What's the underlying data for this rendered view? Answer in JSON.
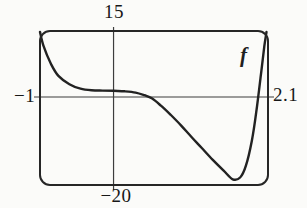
{
  "figure": {
    "function_label": "f",
    "ticks": {
      "top": "15",
      "left": "−1",
      "right": "2.1",
      "bottom": "−20"
    }
  },
  "chart_data": {
    "type": "line",
    "title": "",
    "xlabel": "",
    "ylabel": "",
    "xlim": [
      -1,
      2.1
    ],
    "ylim": [
      -20,
      15
    ],
    "grid": false,
    "legend_position": "inline-top-right",
    "axes": "centered cross axes inside rounded viewport, tick values shown at window edges",
    "tick_labels": {
      "x": [
        "−1",
        "2.1"
      ],
      "y": [
        "15",
        "−20"
      ]
    },
    "series": [
      {
        "name": "f",
        "points": [
          [
            -1,
            14.8
          ],
          [
            -0.95,
            11.5
          ],
          [
            -0.85,
            7.5
          ],
          [
            -0.75,
            4.8
          ],
          [
            -0.6,
            2.9
          ],
          [
            -0.45,
            1.9
          ],
          [
            -0.3,
            1.55
          ],
          [
            -0.15,
            1.45
          ],
          [
            0,
            1.4
          ],
          [
            0.15,
            1.3
          ],
          [
            0.3,
            1.0
          ],
          [
            0.42,
            0.4
          ],
          [
            0.52,
            -0.3
          ],
          [
            0.64,
            -1.9
          ],
          [
            0.78,
            -4.1
          ],
          [
            0.92,
            -6.5
          ],
          [
            1.06,
            -9.1
          ],
          [
            1.2,
            -11.6
          ],
          [
            1.35,
            -14.3
          ],
          [
            1.5,
            -16.8
          ],
          [
            1.62,
            -18.7
          ],
          [
            1.72,
            -18.3
          ],
          [
            1.8,
            -15.6
          ],
          [
            1.88,
            -10.0
          ],
          [
            1.94,
            -3.5
          ],
          [
            2.0,
            4.5
          ],
          [
            2.05,
            11.5
          ],
          [
            2.08,
            14.8
          ]
        ]
      }
    ],
    "colors": {
      "curve": "#222222",
      "viewport_border": "#262626",
      "axis": "#3d3d3d",
      "background": "#fbfbf9"
    }
  }
}
